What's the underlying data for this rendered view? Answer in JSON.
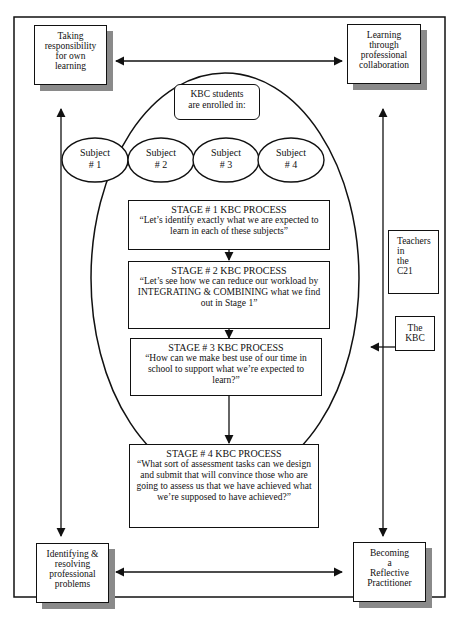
{
  "corners": {
    "top_left": [
      "Taking",
      "responsibility",
      "for own",
      "learning"
    ],
    "top_right": [
      "Learning",
      "through",
      "professional",
      "collaboration"
    ],
    "bottom_left": [
      "Identifying &",
      "resolving",
      "professional",
      "problems"
    ],
    "bottom_right": [
      "Becoming",
      "a",
      "Reflective",
      "Practitioner"
    ]
  },
  "enrolled": [
    "KBC students",
    "are enrolled in:"
  ],
  "subjects": [
    {
      "line1": "Subject",
      "line2": "# 1"
    },
    {
      "line1": "Subject",
      "line2": "# 2"
    },
    {
      "line1": "Subject",
      "line2": "# 3"
    },
    {
      "line1": "Subject",
      "line2": "# 4"
    }
  ],
  "stages": [
    {
      "title": "STAGE # 1 KBC PROCESS",
      "text": "“Let’s identify exactly what we are expected to learn in each of these subjects”"
    },
    {
      "title": "STAGE # 2 KBC PROCESS",
      "text": "“Let’s see how we can reduce our workload by INTEGRATING & COMBINING what we find out in Stage 1”"
    },
    {
      "title": "STAGE # 3 KBC PROCESS",
      "text": "“How can we make best use of our time in school to support what we’re expected to learn?”"
    },
    {
      "title": "STAGE # 4 KBC PROCESS",
      "text": "“What sort of assessment tasks can we design and submit that will convince those who are going to assess us that we have achieved what we’re supposed to have achieved?”"
    }
  ],
  "side_labels": {
    "teachers": [
      "Teachers",
      "in",
      "the",
      "C21"
    ],
    "kbc": [
      "The",
      "KBC"
    ]
  }
}
